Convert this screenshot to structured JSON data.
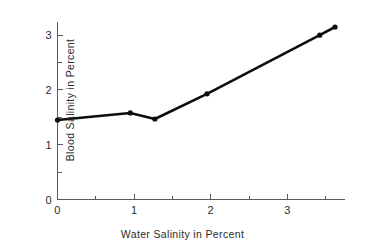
{
  "chart_data": {
    "type": "line",
    "title": "",
    "xlabel": "Water Salinity in Percent",
    "ylabel": "Blood Salinity in Percent",
    "xlim": [
      0,
      3.75
    ],
    "ylim": [
      0,
      3.25
    ],
    "grid": false,
    "legend": "none",
    "line_color": "#0d0d0d",
    "axis_color": "#5a5a5a",
    "background_color": "#ffffff",
    "marker": "circle",
    "x_ticks_major": [
      0,
      1,
      2,
      3
    ],
    "x_tick_labels": [
      "0",
      "1",
      "2",
      "3"
    ],
    "x_ticks_minor": [
      0.5,
      1.5,
      2.5,
      3.5
    ],
    "y_ticks_major": [
      0,
      1,
      2,
      3
    ],
    "y_tick_labels": [
      "0",
      "1",
      "2",
      "3"
    ],
    "y_ticks_minor": [
      0.5,
      1.5,
      2.5
    ],
    "series": [
      {
        "name": "blood salinity",
        "x": [
          0.0,
          0.95,
          1.27,
          1.95,
          3.42,
          3.62
        ],
        "values": [
          1.45,
          1.58,
          1.47,
          1.93,
          3.0,
          3.15
        ]
      }
    ]
  },
  "axis_titles": {
    "x": "Water Salinity in Percent",
    "y": "Blood Salinity in Percent"
  }
}
